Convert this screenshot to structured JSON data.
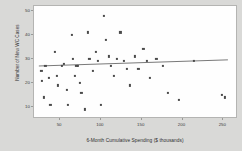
{
  "chart_data": {
    "type": "scatter",
    "title": "",
    "xlabel": "6-Month Cumulative Spending ($ thousands)",
    "ylabel": "Number of New WC Cases",
    "xlim": [
      18,
      268
    ],
    "ylim": [
      5,
      52
    ],
    "xticks": [
      50,
      100,
      150,
      200,
      250
    ],
    "yticks": [
      10,
      20,
      30,
      40,
      50
    ],
    "grid": false,
    "legend": null,
    "marker_color": "#4a4a4a",
    "line_color": "#6a6a6a",
    "plot_background": "#fefefe",
    "figure_background": "#d9d9d7",
    "points": [
      {
        "x": 27,
        "y": 25
      },
      {
        "x": 28,
        "y": 21
      },
      {
        "x": 30,
        "y": 14
      },
      {
        "x": 32,
        "y": 27
      },
      {
        "x": 36,
        "y": 22
      },
      {
        "x": 38,
        "y": 11
      },
      {
        "x": 44,
        "y": 33
      },
      {
        "x": 46,
        "y": 23
      },
      {
        "x": 47,
        "y": 19
      },
      {
        "x": 52,
        "y": 27
      },
      {
        "x": 55,
        "y": 28
      },
      {
        "x": 58,
        "y": 17
      },
      {
        "x": 60,
        "y": 11
      },
      {
        "x": 64,
        "y": 40
      },
      {
        "x": 66,
        "y": 30
      },
      {
        "x": 68,
        "y": 23
      },
      {
        "x": 70,
        "y": 27
      },
      {
        "x": 72,
        "y": 27
      },
      {
        "x": 74,
        "y": 20
      },
      {
        "x": 76,
        "y": 16
      },
      {
        "x": 80,
        "y": 9
      },
      {
        "x": 84,
        "y": 41
      },
      {
        "x": 86,
        "y": 30
      },
      {
        "x": 90,
        "y": 25
      },
      {
        "x": 94,
        "y": 33
      },
      {
        "x": 96,
        "y": 29
      },
      {
        "x": 100,
        "y": 11
      },
      {
        "x": 104,
        "y": 48
      },
      {
        "x": 106,
        "y": 38
      },
      {
        "x": 110,
        "y": 31
      },
      {
        "x": 112,
        "y": 27
      },
      {
        "x": 116,
        "y": 23
      },
      {
        "x": 120,
        "y": 30
      },
      {
        "x": 124,
        "y": 41
      },
      {
        "x": 128,
        "y": 29
      },
      {
        "x": 132,
        "y": 26
      },
      {
        "x": 136,
        "y": 19
      },
      {
        "x": 142,
        "y": 31
      },
      {
        "x": 146,
        "y": 26
      },
      {
        "x": 152,
        "y": 34
      },
      {
        "x": 156,
        "y": 29
      },
      {
        "x": 160,
        "y": 22
      },
      {
        "x": 168,
        "y": 30
      },
      {
        "x": 176,
        "y": 27
      },
      {
        "x": 182,
        "y": 16
      },
      {
        "x": 196,
        "y": 13
      },
      {
        "x": 214,
        "y": 29
      },
      {
        "x": 248,
        "y": 15
      },
      {
        "x": 252,
        "y": 14
      }
    ],
    "trendline": {
      "type": "linear-fit",
      "x_start": 24,
      "y_start": 26.6,
      "x_end": 258,
      "y_end": 29.2
    }
  }
}
